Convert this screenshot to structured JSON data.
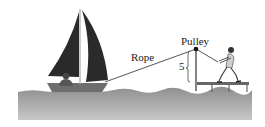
{
  "diagram": {
    "labels": {
      "rope": "Rope",
      "pulley": "Pulley",
      "height": "5"
    },
    "colors": {
      "water_top": "#9a9a9a",
      "water_bottom": "#c4c4c4",
      "sail": "#2a2a2a",
      "line": "#555555",
      "background": "#ffffff"
    }
  }
}
